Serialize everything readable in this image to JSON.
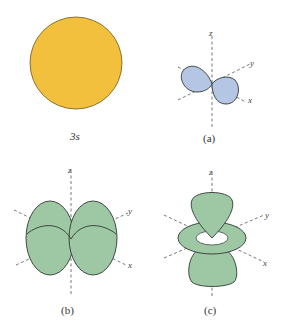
{
  "figure": {
    "panels": [
      {
        "id": "3s",
        "label": "3s",
        "shape": "sphere",
        "color": "#f2c03c"
      },
      {
        "id": "a",
        "label": "(a)",
        "shape": "p-orbital (two lobes)",
        "color": "#b5c6e4",
        "axes": [
          "z",
          "y",
          "x"
        ]
      },
      {
        "id": "b",
        "label": "(b)",
        "shape": "d-orbital (four lobes, dxy-type)",
        "color": "#9ec7a4",
        "axes": [
          "z",
          "y",
          "x"
        ]
      },
      {
        "id": "c",
        "label": "(c)",
        "shape": "dz2-orbital (two lobes with torus)",
        "color": "#9ec7a4",
        "axes": [
          "z",
          "y",
          "x"
        ]
      }
    ],
    "axis_labels": {
      "z": "z",
      "y": "y",
      "x": "x"
    },
    "colors": {
      "yellow": "#f2c03c",
      "blue": "#b5c6e4",
      "green": "#9ec7a4",
      "outline": "#2f3a33"
    }
  }
}
